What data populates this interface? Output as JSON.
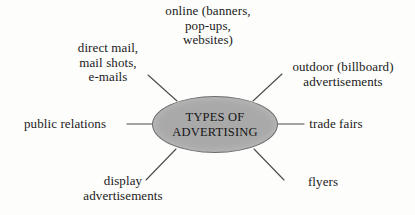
{
  "diagram": {
    "type": "mind-map",
    "center": {
      "name": "types-of-advertising",
      "lines": [
        "TYPES OF",
        "ADVERTISING"
      ],
      "fill_color": "#a9a9a9",
      "border_color": "#6f6f6f",
      "shape": "ellipse"
    },
    "background_color": "#fdfdfc",
    "text_color": "#1a1a1a",
    "connector_color": "#4a4a4a",
    "branches": [
      {
        "name": "online",
        "lines": [
          "online (banners,",
          "pop-ups,",
          "websites)"
        ],
        "position": "top"
      },
      {
        "name": "direct-mail",
        "lines": [
          "direct mail,",
          "mail shots,",
          "e-mails"
        ],
        "position": "top-left"
      },
      {
        "name": "outdoor-advertisements",
        "lines": [
          "outdoor (billboard)",
          "advertisements"
        ],
        "position": "top-right"
      },
      {
        "name": "public-relations",
        "lines": [
          "public relations"
        ],
        "position": "left"
      },
      {
        "name": "trade-fairs",
        "lines": [
          "trade fairs"
        ],
        "position": "right"
      },
      {
        "name": "display-advertisements",
        "lines": [
          "display",
          "advertisements"
        ],
        "position": "bottom-left"
      },
      {
        "name": "flyers",
        "lines": [
          "flyers"
        ],
        "position": "bottom-right"
      }
    ]
  }
}
